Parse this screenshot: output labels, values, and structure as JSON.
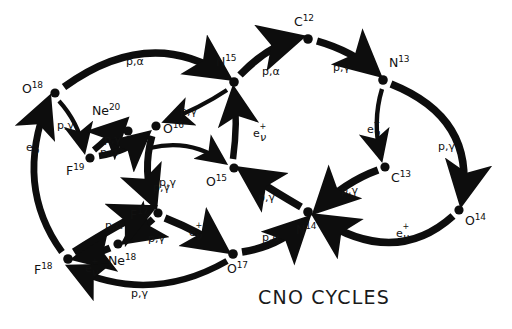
{
  "title": "CNO CYCLES",
  "colors": {
    "ink": "#0d0d0d",
    "background": "#ffffff"
  },
  "nodes": [
    {
      "id": "O18",
      "element": "O",
      "mass": "18",
      "x": 55,
      "y": 93,
      "label_x": 22,
      "label_y": 81
    },
    {
      "id": "Ne20",
      "element": "Ne",
      "mass": "20",
      "x": 128,
      "y": 131,
      "label_x": 92,
      "label_y": 103
    },
    {
      "id": "F19",
      "element": "F",
      "mass": "19",
      "x": 90,
      "y": 158,
      "label_x": 66,
      "label_y": 163
    },
    {
      "id": "O16",
      "element": "O",
      "mass": "16",
      "x": 156,
      "y": 126,
      "label_x": 163,
      "label_y": 121
    },
    {
      "id": "N15",
      "element": "N",
      "mass": "15",
      "x": 234,
      "y": 82,
      "label_x": 216,
      "label_y": 54
    },
    {
      "id": "C12",
      "element": "C",
      "mass": "12",
      "x": 308,
      "y": 39,
      "label_x": 294,
      "label_y": 14
    },
    {
      "id": "N13",
      "element": "N",
      "mass": "13",
      "x": 383,
      "y": 80,
      "label_x": 389,
      "label_y": 55
    },
    {
      "id": "O15",
      "element": "O",
      "mass": "15",
      "x": 234,
      "y": 168,
      "label_x": 206,
      "label_y": 174
    },
    {
      "id": "C13",
      "element": "C",
      "mass": "13",
      "x": 385,
      "y": 167,
      "label_x": 391,
      "label_y": 170
    },
    {
      "id": "O14",
      "element": "O",
      "mass": "14",
      "x": 459,
      "y": 210,
      "label_x": 465,
      "label_y": 213
    },
    {
      "id": "N14",
      "element": "N",
      "mass": "14",
      "x": 308,
      "y": 212,
      "label_x": 296,
      "label_y": 222
    },
    {
      "id": "F17",
      "element": "F",
      "mass": "17",
      "x": 158,
      "y": 213,
      "label_x": 130,
      "label_y": 207
    },
    {
      "id": "Ne18",
      "element": "Ne",
      "mass": "18",
      "x": 118,
      "y": 244,
      "label_x": 108,
      "label_y": 253
    },
    {
      "id": "O17",
      "element": "O",
      "mass": "17",
      "x": 233,
      "y": 254,
      "label_x": 227,
      "label_y": 261
    },
    {
      "id": "F18",
      "element": "F",
      "mass": "18",
      "x": 68,
      "y": 259,
      "label_x": 34,
      "label_y": 262
    }
  ],
  "reactions": [
    {
      "from": "O18",
      "to": "N15",
      "kind": "p,alpha",
      "label": "p,α",
      "label_x": 126,
      "label_y": 56,
      "thick": true
    },
    {
      "from": "O18",
      "to": "F19",
      "kind": "p,gamma",
      "label": "p,γ",
      "label_x": 57,
      "label_y": 120,
      "thick": false
    },
    {
      "from": "F18",
      "to": "O18",
      "kind": "beta",
      "label": "beta",
      "label_x": 26,
      "label_y": 140,
      "thick": true
    },
    {
      "from": "F19",
      "to": "Ne20",
      "kind": "p,gamma",
      "label": "p,γ",
      "label_x": 104,
      "label_y": 134,
      "thick": true
    },
    {
      "from": "F19",
      "to": "O16",
      "kind": "p,alpha",
      "label": "p,α",
      "label_x": 100,
      "label_y": 147,
      "thick": true
    },
    {
      "from": "N15",
      "to": "O16",
      "kind": "p,gamma",
      "label": "p,γ",
      "label_x": 180,
      "label_y": 106,
      "thick": false
    },
    {
      "from": "N15",
      "to": "C12",
      "kind": "p,alpha",
      "label": "p,α",
      "label_x": 262,
      "label_y": 66,
      "thick": true
    },
    {
      "from": "C12",
      "to": "N13",
      "kind": "p,gamma",
      "label": "p,γ",
      "label_x": 333,
      "label_y": 62,
      "thick": true
    },
    {
      "from": "N13",
      "to": "C13",
      "kind": "beta",
      "label": "beta",
      "label_x": 367,
      "label_y": 122,
      "thick": false
    },
    {
      "from": "N13",
      "to": "O14",
      "kind": "p,gamma",
      "label": "p,γ",
      "label_x": 438,
      "label_y": 141,
      "thick": true
    },
    {
      "from": "C13",
      "to": "N14",
      "kind": "p,gamma",
      "label": "p,γ",
      "label_x": 341,
      "label_y": 185,
      "thick": true
    },
    {
      "from": "O14",
      "to": "N14",
      "kind": "beta",
      "label": "beta",
      "label_x": 396,
      "label_y": 226,
      "thick": true
    },
    {
      "from": "N14",
      "to": "O15",
      "kind": "p,gamma",
      "label": "p,γ",
      "label_x": 258,
      "label_y": 192,
      "thick": true
    },
    {
      "from": "O15",
      "to": "N15",
      "kind": "beta",
      "label": "beta",
      "label_x": 253,
      "label_y": 126,
      "thick": true
    },
    {
      "from": "O16",
      "to": "O15",
      "kind": "p,gamma",
      "label": "p,γ",
      "label_x": 153,
      "label_y": 182,
      "thick": false
    },
    {
      "from": "O16",
      "to": "F17",
      "kind": "p,gamma",
      "label": "p,γ",
      "label_x": 159,
      "label_y": 177,
      "thick": true
    },
    {
      "from": "F17",
      "to": "O17",
      "kind": "beta",
      "label": "beta",
      "label_x": 189,
      "label_y": 225,
      "thick": true
    },
    {
      "from": "F17",
      "to": "Ne18",
      "kind": "p,gamma",
      "label": "p,γ",
      "label_x": 148,
      "label_y": 233,
      "thick": true
    },
    {
      "from": "Ne18",
      "to": "F18",
      "kind": "beta",
      "label": "beta",
      "label_x": 85,
      "label_y": 261,
      "thick": true
    },
    {
      "from": "O17",
      "to": "N14",
      "kind": "p,alpha",
      "label": "p,α",
      "label_x": 262,
      "label_y": 232,
      "thick": true
    },
    {
      "from": "O17",
      "to": "F18",
      "kind": "p,gamma",
      "label": "p,γ",
      "label_x": 131,
      "label_y": 288,
      "thick": true
    },
    {
      "from": "F18",
      "to": "F17",
      "kind": "p,alpha",
      "label": "p,α",
      "label_x": 105,
      "label_y": 220,
      "thick": true
    }
  ]
}
